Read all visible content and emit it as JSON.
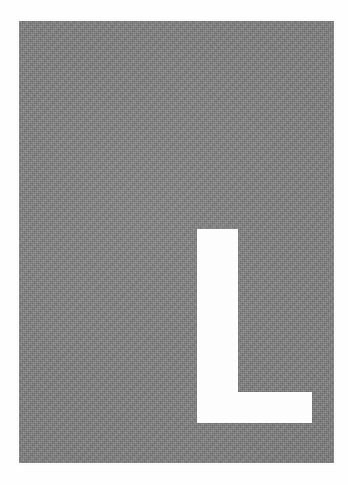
{
  "image": {
    "kind": "letter-placard",
    "description": "White capital letter L on a textured grey rectangular placard",
    "width": 348,
    "height": 485,
    "background_color": "#fefefe"
  },
  "placard": {
    "name": "grey-placard",
    "fill_color": "#808080",
    "texture": "fine grain noise",
    "x": 19,
    "y": 21,
    "width": 315,
    "height": 442
  },
  "glyph": {
    "character": "L",
    "color": "#fdfdfd",
    "alignment": "bottom-right",
    "stem": {
      "x": 197,
      "y": 229,
      "width": 41,
      "height": 194
    },
    "foot": {
      "x": 197,
      "y": 392,
      "width": 115,
      "height": 31
    }
  },
  "labels": {
    "alt_text": "L"
  }
}
